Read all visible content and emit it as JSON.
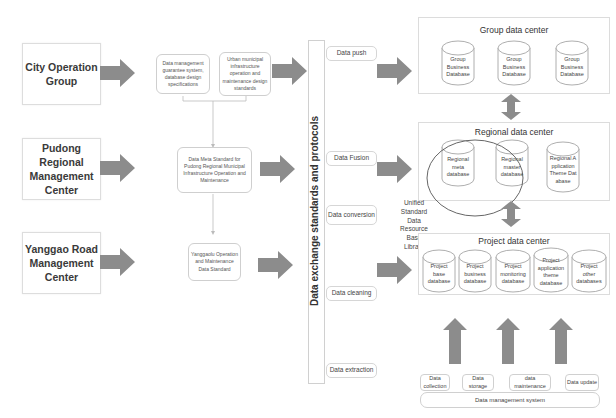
{
  "organizations": [
    {
      "label": "City Operation Group"
    },
    {
      "label": "Pudong Regional Management Center"
    },
    {
      "label": "Yanggao Road Management Center"
    }
  ],
  "standards": {
    "top_left": "Data management guarantee system, database design specifications",
    "top_right": "Urban municipal infrastructure operation and maintenance design standards",
    "middle": "Data Meta Standard for Pudong Regional Municipal Infrastructure Operation and Maintenance",
    "bottom": "Yanggaolu Operation and Maintenance Data Standard"
  },
  "exchange_bar": {
    "label": "Data exchange standards and protocols"
  },
  "processes": [
    {
      "label": "Data push"
    },
    {
      "label": "Data Fusion"
    },
    {
      "label": "Data conversion"
    },
    {
      "label": "Data cleaning"
    },
    {
      "label": "Data extraction"
    }
  ],
  "group_center": {
    "title": "Group data center",
    "databases": [
      {
        "label": "Group Business Database"
      },
      {
        "label": "Group Business Database"
      },
      {
        "label": "Group Business Database"
      }
    ]
  },
  "regional_center": {
    "title": "Regional data center",
    "databases": [
      {
        "label": "Regional meta database"
      },
      {
        "label": "Regional master database"
      },
      {
        "label": "Regional Application Theme Database"
      }
    ]
  },
  "unified_library": {
    "label": "Unified Standard Data Resource Base Library"
  },
  "project_center": {
    "title": "Project data center",
    "databases": [
      {
        "label": "Project base database"
      },
      {
        "label": "Project business database"
      },
      {
        "label": "Project monitoring database"
      },
      {
        "label": "Project application theme database"
      },
      {
        "label": "Project other databases"
      }
    ]
  },
  "management": {
    "items": [
      {
        "label": "Data collection"
      },
      {
        "label": "Data storage"
      },
      {
        "label": "data maintenance"
      },
      {
        "label": "Data update"
      }
    ],
    "system_label": "Data management system"
  },
  "colors": {
    "arrow": "#8c8c8c",
    "border": "#d0d0d0",
    "text": "#333333"
  }
}
